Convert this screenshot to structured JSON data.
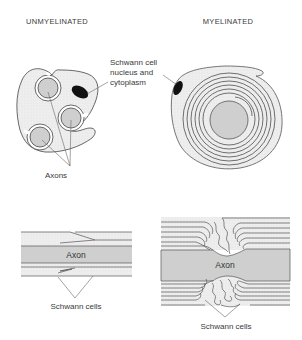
{
  "titles": {
    "left": "UNMYELINATED",
    "right": "MYELINATED"
  },
  "labels": {
    "schwann_nucleus_line1": "Schwann cell",
    "schwann_nucleus_line2": "nucleus and",
    "schwann_nucleus_line3": "cytoplasm",
    "axons": "Axons",
    "axon_left": "Axon",
    "axon_right": "Axon",
    "schwann_cells_left": "Schwann cells",
    "schwann_cells_right": "Schwann cells"
  },
  "colors": {
    "cytoplasm": "#ececec",
    "axon_fill": "#cfcfcf",
    "outline": "#444444",
    "nucleus": "#111111"
  }
}
